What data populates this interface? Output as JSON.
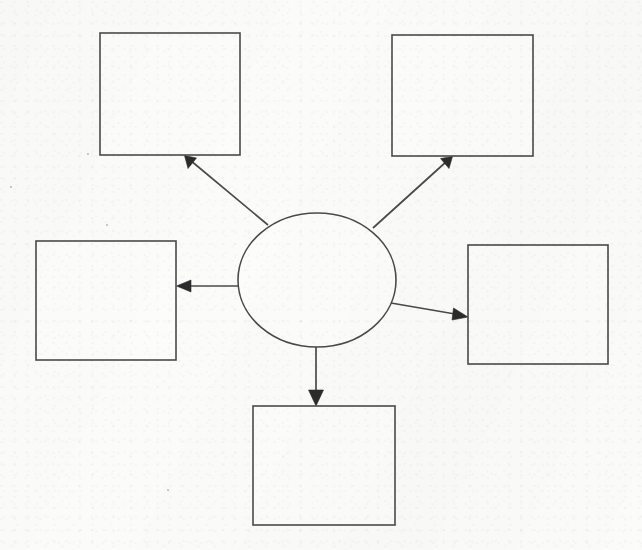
{
  "document": {
    "title": "Blank Concept Map Worksheet",
    "page_width": 642,
    "page_height": 550,
    "background_color": "#fbfbfa",
    "ink_color": "#4a4a4a",
    "arrow_color": "#2b2b2b"
  },
  "diagram": {
    "type": "concept-map",
    "layout": "radial-spider",
    "center": {
      "shape": "ellipse",
      "label": "",
      "cx": 317,
      "cy": 280,
      "rx": 79,
      "ry": 67
    },
    "nodes": [
      {
        "id": "top-left",
        "shape": "rectangle",
        "label": "",
        "x": 100,
        "y": 33,
        "width": 140,
        "height": 122
      },
      {
        "id": "top-right",
        "shape": "rectangle",
        "label": "",
        "x": 392,
        "y": 35,
        "width": 141,
        "height": 121
      },
      {
        "id": "middle-left",
        "shape": "rectangle",
        "label": "",
        "x": 36,
        "y": 241,
        "width": 140,
        "height": 119
      },
      {
        "id": "middle-right",
        "shape": "rectangle",
        "label": "",
        "x": 468,
        "y": 245,
        "width": 140,
        "height": 119
      },
      {
        "id": "bottom",
        "shape": "rectangle",
        "label": "",
        "x": 253,
        "y": 406,
        "width": 142,
        "height": 119
      }
    ],
    "connectors": [
      {
        "id": "center-to-top-left",
        "from": "center",
        "to": "top-left",
        "label": "",
        "arrowhead": "target",
        "x1": 268,
        "y1": 225,
        "x2": 186,
        "y2": 156,
        "angle_deg": 220
      },
      {
        "id": "center-to-top-right",
        "from": "center",
        "to": "top-right",
        "label": "",
        "arrowhead": "target",
        "x1": 373,
        "y1": 228,
        "x2": 451,
        "y2": 157,
        "angle_deg": 318
      },
      {
        "id": "center-to-middle-left",
        "from": "center",
        "to": "middle-left",
        "label": "",
        "arrowhead": "target",
        "x1": 238,
        "y1": 286,
        "x2": 177,
        "y2": 286,
        "angle_deg": 180
      },
      {
        "id": "center-to-middle-right",
        "from": "center",
        "to": "middle-right",
        "label": "",
        "arrowhead": "target",
        "x1": 391,
        "y1": 303,
        "x2": 467,
        "y2": 317,
        "angle_deg": 10
      },
      {
        "id": "center-to-bottom",
        "from": "center",
        "to": "bottom",
        "label": "",
        "arrowhead": "target",
        "x1": 316,
        "y1": 347,
        "x2": 316,
        "y2": 406,
        "angle_deg": 90
      }
    ]
  }
}
